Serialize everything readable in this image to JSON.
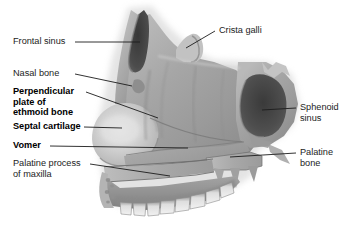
{
  "figure": {
    "type": "anatomical-illustration",
    "view": "medial / sagittal",
    "background_color": "#ffffff",
    "line_color": "#1c1c1c",
    "text_color": "#1c1c1c"
  },
  "labels": {
    "frontal_sinus": "Frontal sinus",
    "nasal_bone": "Nasal bone",
    "perpendicular_plate": "Perpendicular\nplate of\nethmoid bone",
    "septal_cartilage": "Septal cartilage",
    "vomer": "Vomer",
    "palatine_process": "Palatine process\nof maxilla",
    "crista_galli": "Crista galli",
    "sphenoid_sinus": "Sphenoid\nsinus",
    "palatine_bone": "Palatine\nbone"
  },
  "label_styles": {
    "frontal_sinus": "regular",
    "nasal_bone": "regular",
    "perpendicular_plate": "bold",
    "septal_cartilage": "bold",
    "vomer": "bold",
    "palatine_process": "regular",
    "crista_galli": "regular",
    "sphenoid_sinus": "regular",
    "palatine_bone": "regular"
  },
  "structures": [
    {
      "name": "frontal-sinus",
      "kind": "air sinus",
      "shade": "dark cavity"
    },
    {
      "name": "crista-galli",
      "kind": "bony crest",
      "shade": "light bone"
    },
    {
      "name": "nasal-bone",
      "kind": "bone",
      "shade": "mid bone"
    },
    {
      "name": "perpendicular-plate-of-ethmoid-bone",
      "kind": "bone plate",
      "shade": "mid bone"
    },
    {
      "name": "septal-cartilage",
      "kind": "cartilage",
      "shade": "pale"
    },
    {
      "name": "vomer",
      "kind": "bone",
      "shade": "mid bone"
    },
    {
      "name": "sphenoid-sinus",
      "kind": "air sinus",
      "shade": "dark cavity"
    },
    {
      "name": "palatine-bone",
      "kind": "bone",
      "shade": "mid bone"
    },
    {
      "name": "palatine-process-of-maxilla",
      "kind": "bone",
      "shade": "mid bone"
    },
    {
      "name": "maxillary-teeth",
      "kind": "teeth row",
      "shade": "pale"
    }
  ]
}
